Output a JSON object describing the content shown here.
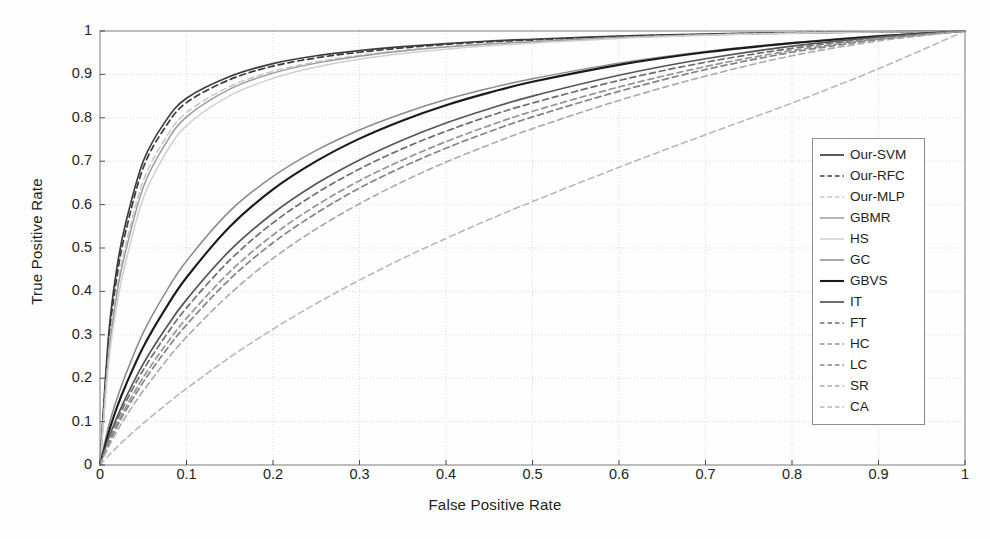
{
  "chart_data": {
    "type": "line",
    "title": "",
    "xlabel": "False Positive Rate",
    "ylabel": "True Positive Rate",
    "xlim": [
      0,
      1
    ],
    "ylim": [
      0,
      1
    ],
    "grid": true,
    "legend_position": "right-inside",
    "xticks": [
      "0",
      "0.1",
      "0.2",
      "0.3",
      "0.4",
      "0.5",
      "0.6",
      "0.7",
      "0.8",
      "0.9",
      "1"
    ],
    "yticks": [
      "0",
      "0.1",
      "0.2",
      "0.3",
      "0.4",
      "0.5",
      "0.6",
      "0.7",
      "0.8",
      "0.9",
      "1"
    ],
    "x": [
      0,
      0.01,
      0.02,
      0.03,
      0.05,
      0.075,
      0.1,
      0.15,
      0.2,
      0.25,
      0.3,
      0.35,
      0.4,
      0.45,
      0.5,
      0.6,
      0.7,
      0.8,
      0.9,
      1
    ],
    "series": [
      {
        "name": "Our-SVM",
        "style": "solid",
        "color": "#3c3c3c",
        "width": 1.7,
        "values": [
          0,
          0.3,
          0.46,
          0.56,
          0.7,
          0.79,
          0.845,
          0.895,
          0.925,
          0.943,
          0.955,
          0.964,
          0.971,
          0.977,
          0.981,
          0.988,
          0.993,
          0.996,
          0.998,
          1
        ]
      },
      {
        "name": "Our-RFC",
        "style": "dashed",
        "color": "#3c3c3c",
        "width": 1.7,
        "values": [
          0,
          0.28,
          0.44,
          0.54,
          0.685,
          0.777,
          0.835,
          0.888,
          0.919,
          0.938,
          0.951,
          0.961,
          0.969,
          0.975,
          0.979,
          0.987,
          0.992,
          0.996,
          0.998,
          1
        ]
      },
      {
        "name": "Our-MLP",
        "style": "dashed",
        "color": "#c6c6c6",
        "width": 1.5,
        "values": [
          0,
          0.26,
          0.41,
          0.51,
          0.655,
          0.75,
          0.812,
          0.872,
          0.907,
          0.929,
          0.944,
          0.955,
          0.964,
          0.971,
          0.976,
          0.985,
          0.991,
          0.995,
          0.998,
          1
        ]
      },
      {
        "name": "GBMR",
        "style": "solid",
        "color": "#9b9b9b",
        "width": 1.5,
        "values": [
          0,
          0.25,
          0.4,
          0.495,
          0.64,
          0.738,
          0.802,
          0.866,
          0.903,
          0.926,
          0.942,
          0.954,
          0.963,
          0.97,
          0.975,
          0.985,
          0.991,
          0.995,
          0.998,
          1
        ]
      },
      {
        "name": "HS",
        "style": "solid",
        "color": "#cfcfcf",
        "width": 1.5,
        "values": [
          0,
          0.235,
          0.375,
          0.47,
          0.615,
          0.715,
          0.782,
          0.851,
          0.891,
          0.917,
          0.935,
          0.948,
          0.958,
          0.966,
          0.972,
          0.983,
          0.99,
          0.995,
          0.998,
          1
        ]
      },
      {
        "name": "GC",
        "style": "solid",
        "color": "#8a8a8a",
        "width": 1.5,
        "values": [
          0,
          0.09,
          0.155,
          0.21,
          0.305,
          0.395,
          0.47,
          0.585,
          0.665,
          0.725,
          0.772,
          0.81,
          0.842,
          0.868,
          0.89,
          0.926,
          0.953,
          0.973,
          0.989,
          1
        ]
      },
      {
        "name": "GBVS",
        "style": "solid",
        "color": "#1a1a1a",
        "width": 2.1,
        "values": [
          0,
          0.075,
          0.135,
          0.185,
          0.272,
          0.358,
          0.432,
          0.549,
          0.635,
          0.7,
          0.752,
          0.794,
          0.829,
          0.858,
          0.883,
          0.922,
          0.951,
          0.972,
          0.988,
          1
        ]
      },
      {
        "name": "IT",
        "style": "solid",
        "color": "#555555",
        "width": 1.7,
        "values": [
          0,
          0.062,
          0.112,
          0.156,
          0.233,
          0.312,
          0.381,
          0.494,
          0.58,
          0.648,
          0.703,
          0.749,
          0.788,
          0.821,
          0.85,
          0.898,
          0.936,
          0.965,
          0.986,
          1
        ]
      },
      {
        "name": "FT",
        "style": "dashed",
        "color": "#6e6e6e",
        "width": 1.7,
        "values": [
          0,
          0.058,
          0.105,
          0.146,
          0.219,
          0.295,
          0.362,
          0.472,
          0.558,
          0.626,
          0.682,
          0.729,
          0.769,
          0.804,
          0.834,
          0.886,
          0.928,
          0.96,
          0.984,
          1
        ]
      },
      {
        "name": "HC",
        "style": "dashed",
        "color": "#949494",
        "width": 1.7,
        "values": [
          0,
          0.052,
          0.096,
          0.134,
          0.202,
          0.274,
          0.338,
          0.445,
          0.53,
          0.598,
          0.655,
          0.703,
          0.745,
          0.782,
          0.815,
          0.871,
          0.918,
          0.955,
          0.982,
          1
        ]
      },
      {
        "name": "LC",
        "style": "dashed",
        "color": "#848484",
        "width": 1.7,
        "values": [
          0,
          0.048,
          0.09,
          0.126,
          0.191,
          0.261,
          0.323,
          0.428,
          0.512,
          0.58,
          0.638,
          0.687,
          0.73,
          0.768,
          0.802,
          0.861,
          0.911,
          0.951,
          0.98,
          1
        ]
      },
      {
        "name": "SR",
        "style": "dashed",
        "color": "#a8a8a8",
        "width": 1.6,
        "values": [
          0,
          0.042,
          0.079,
          0.112,
          0.171,
          0.236,
          0.295,
          0.394,
          0.476,
          0.544,
          0.602,
          0.653,
          0.698,
          0.738,
          0.775,
          0.84,
          0.896,
          0.943,
          0.977,
          1
        ]
      },
      {
        "name": "CA",
        "style": "dashed",
        "color": "#b8b8b8",
        "width": 1.6,
        "values": [
          0,
          0.022,
          0.042,
          0.061,
          0.096,
          0.137,
          0.176,
          0.248,
          0.313,
          0.372,
          0.426,
          0.476,
          0.522,
          0.566,
          0.607,
          0.686,
          0.761,
          0.834,
          0.913,
          1
        ]
      }
    ]
  },
  "legend": {
    "entries": [
      {
        "label": "Our-SVM"
      },
      {
        "label": "Our-RFC"
      },
      {
        "label": "Our-MLP"
      },
      {
        "label": "GBMR"
      },
      {
        "label": "HS"
      },
      {
        "label": "GC"
      },
      {
        "label": "GBVS"
      },
      {
        "label": "IT"
      },
      {
        "label": "FT"
      },
      {
        "label": "HC"
      },
      {
        "label": "LC"
      },
      {
        "label": "SR"
      },
      {
        "label": "CA"
      }
    ]
  },
  "axes": {
    "x_title": "False Positive Rate",
    "y_title": "True Positive Rate"
  }
}
